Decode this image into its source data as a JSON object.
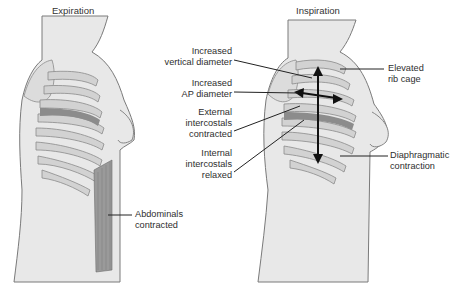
{
  "panels": [
    {
      "id": "expiration",
      "title": "Expiration",
      "labels": [
        {
          "id": "abdominals",
          "lines": [
            "Abdominals",
            "contracted"
          ]
        }
      ]
    },
    {
      "id": "inspiration",
      "title": "Inspiration",
      "labels": [
        {
          "id": "vertical",
          "lines": [
            "Increased",
            "vertical diameter"
          ]
        },
        {
          "id": "ap",
          "lines": [
            "Increased",
            "AP diameter"
          ]
        },
        {
          "id": "external",
          "lines": [
            "External",
            "intercostals",
            "contracted"
          ]
        },
        {
          "id": "internal",
          "lines": [
            "Internal",
            "intercostals",
            "relaxed"
          ]
        },
        {
          "id": "elevated",
          "lines": [
            "Elevated",
            "rib cage"
          ]
        },
        {
          "id": "diaphragm",
          "lines": [
            "Diaphragmatic",
            "contraction"
          ]
        }
      ]
    }
  ],
  "colors": {
    "skin": "#e6e6e6",
    "outline": "#7a7a7a",
    "rib": "#c8c8c8",
    "muscle_dark": "#8c8c8c",
    "arrow": "#111111"
  }
}
